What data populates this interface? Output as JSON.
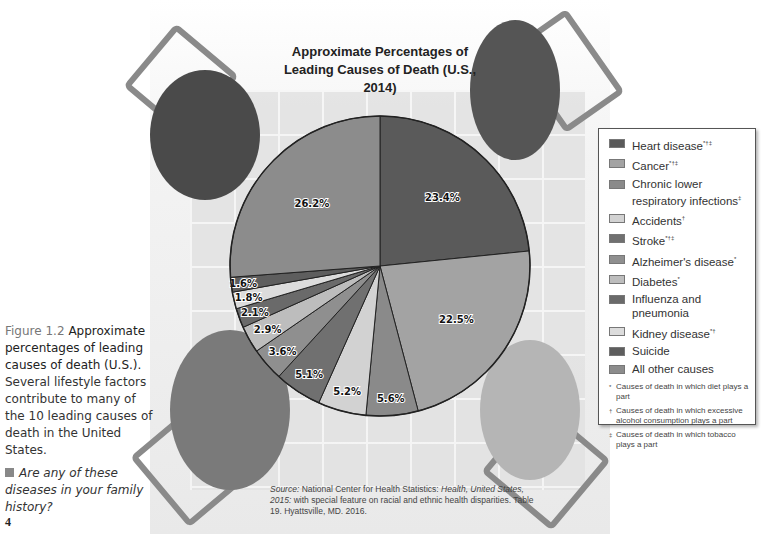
{
  "chart_data": {
    "type": "pie",
    "title": "Approximate Percentages of Leading Causes of Death (U.S., 2014)",
    "start_angle_deg": 0,
    "direction": "clockwise",
    "categories": [
      "Heart disease",
      "Cancer",
      "Chronic lower respiratory infections",
      "Accidents",
      "Stroke",
      "Alzheimer's disease",
      "Diabetes",
      "Influenza and pneumonia",
      "Kidney disease",
      "Suicide",
      "All other causes"
    ],
    "values": [
      23.4,
      22.5,
      5.6,
      5.2,
      5.1,
      3.6,
      2.9,
      2.1,
      1.8,
      1.6,
      26.2
    ],
    "value_labels": [
      "23.4%",
      "22.5%",
      "5.6%",
      "5.2%",
      "5.1%",
      "3.6%",
      "2.9%",
      "2.1%",
      "1.8%",
      "1.6%",
      "26.2%"
    ],
    "colors": [
      "#5a5a5a",
      "#a3a3a3",
      "#8a8a8a",
      "#d2d2d2",
      "#707070",
      "#8f8f8f",
      "#bdbdbd",
      "#6a6a6a",
      "#dcdcdc",
      "#5e5e5e",
      "#8c8c8c"
    ],
    "legend_position": "right",
    "xlabel": "",
    "ylabel": ""
  },
  "title_lines": [
    "Approximate Percentages of",
    "Leading Causes of Death (U.S., 2014)"
  ],
  "legend": {
    "items": [
      {
        "label": "Heart disease",
        "marks": "*†‡"
      },
      {
        "label": "Cancer",
        "marks": "*†‡"
      },
      {
        "label": "Chronic lower respiratory infections",
        "marks": "‡"
      },
      {
        "label": "Accidents",
        "marks": "†"
      },
      {
        "label": "Stroke",
        "marks": "*†‡"
      },
      {
        "label": "Alzheimer's disease",
        "marks": "*"
      },
      {
        "label": "Diabetes",
        "marks": "*"
      },
      {
        "label": "Influenza and pneumonia",
        "marks": ""
      },
      {
        "label": "Kidney disease",
        "marks": "*†"
      },
      {
        "label": "Suicide",
        "marks": ""
      },
      {
        "label": "All other causes",
        "marks": ""
      }
    ],
    "footnotes": [
      {
        "mark": "*",
        "text": "Causes of death in which diet plays a part"
      },
      {
        "mark": "†",
        "text": "Causes of death in which excessive alcohol consumption plays a part"
      },
      {
        "mark": "‡",
        "text": "Causes of death in which tobacco plays a part"
      }
    ]
  },
  "caption": {
    "figure_label": "Figure 1.2",
    "bold_text": "Approximate percentages of leading causes of death (U.S.).",
    "body": "Several lifestyle factors contribute to many of the 10 leading causes of death in the United States.",
    "question": "Are any of these diseases in your family history?"
  },
  "source": {
    "prefix": "Source:",
    "text1": "National Center for Health Statistics:",
    "italic": "Health, United States, 2015:",
    "text2": "with special feature on racial and ethnic health disparities. Table 19. Hyattsville, MD. 2016."
  },
  "page_number": "4"
}
